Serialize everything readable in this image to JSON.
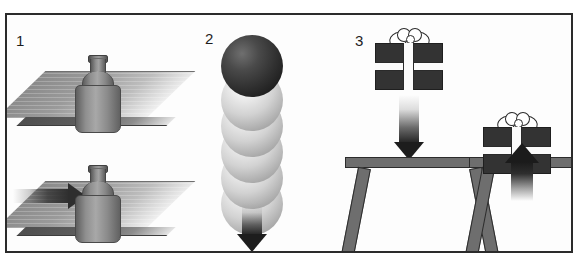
{
  "figure": {
    "cropped_caption_above": "",
    "border_color": "#2b2b2b",
    "background_color": "#fdfdfd",
    "ink_color": "#1d1d1d"
  },
  "panels": [
    {
      "number": "1",
      "name": "bottle-on-table",
      "scenes": [
        {
          "name": "bottle-at-rest",
          "objects": [
            "table-slab",
            "bottle"
          ],
          "arrow": null
        },
        {
          "name": "bottle-being-pushed",
          "objects": [
            "table-slab",
            "bottle"
          ],
          "arrow": "horizontal-right"
        }
      ]
    },
    {
      "number": "2",
      "name": "falling-ball-motion-trail",
      "scenes": [
        {
          "name": "ball-falling",
          "objects": [
            "solid-sphere",
            "trail-spheres"
          ],
          "trail_count": 5,
          "arrow": "vertical-down"
        }
      ]
    },
    {
      "number": "3",
      "name": "gift-box-onto-table",
      "scenes": [
        {
          "name": "gift-falling-toward-table",
          "objects": [
            "gift-box",
            "table"
          ],
          "arrow": "vertical-down"
        },
        {
          "name": "gift-resting-on-table",
          "objects": [
            "gift-box",
            "table"
          ],
          "arrow": "impact-down"
        }
      ]
    }
  ],
  "colors": {
    "object_gray": "#6e6e6e",
    "dark_gray": "#333333",
    "arrow_black": "#1d1d1d",
    "ribbon_white": "#fbfbfb",
    "outline": "#2c2c2c"
  }
}
